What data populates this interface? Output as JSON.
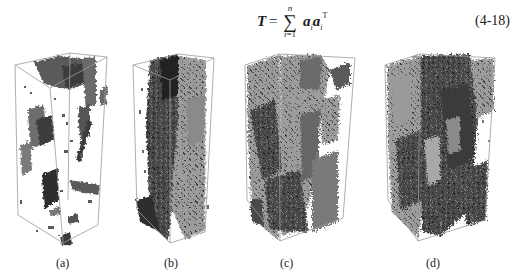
{
  "equation": {
    "lhs": "T",
    "equals": "=",
    "sum_upper": "n",
    "sum_symbol": "∑",
    "sum_lower_var": "i",
    "sum_lower_rest": "=1",
    "term_a1": "a",
    "term_sub": "i",
    "term_a2": "a",
    "term_sub2": "i",
    "term_sup": "T",
    "number": "(4-18)"
  },
  "figure": {
    "panels": [
      {
        "id": "a",
        "caption": "(a)"
      },
      {
        "id": "b",
        "caption": "(b)"
      },
      {
        "id": "c",
        "caption": "(c)"
      },
      {
        "id": "d",
        "caption": "(d)"
      }
    ],
    "colors": {
      "box_edge": "#9a9a9a",
      "dark": "#2e2e2e",
      "mid": "#6c6c6c",
      "light": "#a8a8a8"
    }
  }
}
